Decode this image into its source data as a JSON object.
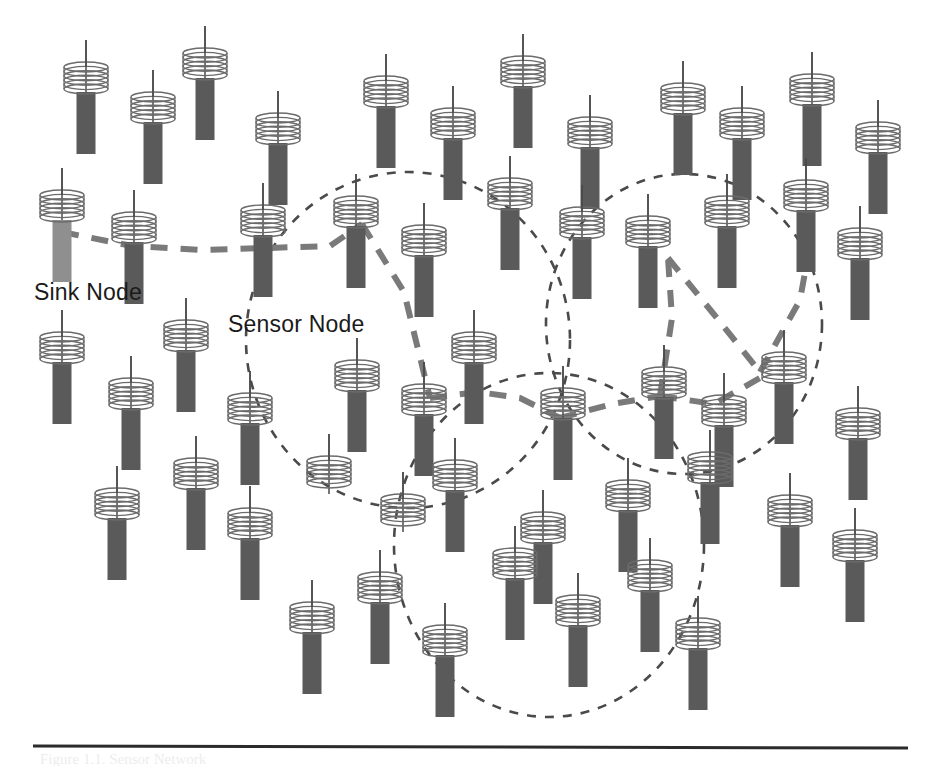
{
  "figure": {
    "background_color": "#ffffff",
    "width": 928,
    "height": 766
  },
  "labels": {
    "sink": "Sink Node",
    "sensor": "Sensor Node",
    "caption_fragment": "Figure 1.1. Sensor Network"
  },
  "colors": {
    "sensor_body": "#5a5a5a",
    "sink_body": "#8f8f8f",
    "coil_stroke": "#6b6b6b",
    "antenna_stroke": "#4a4a4a",
    "cluster_circle": "#4a4a4a",
    "route_link": "#7a7a7a",
    "rule_line": "#2b2b2b",
    "text": "#1a1a1a"
  },
  "glyph": {
    "coil_width": 44,
    "coil_height": 32,
    "coil_turns": 6,
    "body_width": 19,
    "body_height": 62,
    "antenna_height": 22
  },
  "nodes": [
    {
      "id": "n01",
      "x": 86,
      "y": 62,
      "type": "sensor"
    },
    {
      "id": "n02",
      "x": 153,
      "y": 92,
      "type": "sensor"
    },
    {
      "id": "n03",
      "x": 205,
      "y": 48,
      "type": "sensor"
    },
    {
      "id": "n04",
      "x": 278,
      "y": 113,
      "type": "sensor"
    },
    {
      "id": "n05",
      "x": 386,
      "y": 76,
      "type": "sensor"
    },
    {
      "id": "n06",
      "x": 453,
      "y": 108,
      "type": "sensor"
    },
    {
      "id": "n07",
      "x": 523,
      "y": 56,
      "type": "sensor"
    },
    {
      "id": "n08",
      "x": 590,
      "y": 117,
      "type": "sensor"
    },
    {
      "id": "n09",
      "x": 683,
      "y": 83,
      "type": "sensor"
    },
    {
      "id": "n10",
      "x": 742,
      "y": 108,
      "type": "sensor"
    },
    {
      "id": "n11",
      "x": 812,
      "y": 74,
      "type": "sensor"
    },
    {
      "id": "n12",
      "x": 878,
      "y": 122,
      "type": "sensor"
    },
    {
      "id": "n13",
      "x": 62,
      "y": 190,
      "type": "sink"
    },
    {
      "id": "n14",
      "x": 134,
      "y": 212,
      "type": "sensor"
    },
    {
      "id": "n15",
      "x": 263,
      "y": 205,
      "type": "sensor"
    },
    {
      "id": "n16",
      "x": 356,
      "y": 196,
      "type": "sensor"
    },
    {
      "id": "n17",
      "x": 424,
      "y": 225,
      "type": "sensor"
    },
    {
      "id": "n18",
      "x": 510,
      "y": 178,
      "type": "sensor"
    },
    {
      "id": "n19",
      "x": 582,
      "y": 207,
      "type": "sensor"
    },
    {
      "id": "n20",
      "x": 648,
      "y": 216,
      "type": "sensor"
    },
    {
      "id": "n21",
      "x": 727,
      "y": 196,
      "type": "sensor"
    },
    {
      "id": "n22",
      "x": 806,
      "y": 180,
      "type": "sensor"
    },
    {
      "id": "n23",
      "x": 860,
      "y": 228,
      "type": "sensor"
    },
    {
      "id": "n24",
      "x": 62,
      "y": 332,
      "type": "sensor"
    },
    {
      "id": "n25",
      "x": 131,
      "y": 378,
      "type": "sensor"
    },
    {
      "id": "n26",
      "x": 186,
      "y": 320,
      "type": "sensor"
    },
    {
      "id": "n27",
      "x": 250,
      "y": 393,
      "type": "sensor"
    },
    {
      "id": "n28",
      "x": 357,
      "y": 360,
      "type": "sensor"
    },
    {
      "id": "n29",
      "x": 424,
      "y": 384,
      "type": "sensor"
    },
    {
      "id": "n30",
      "x": 474,
      "y": 332,
      "type": "sensor"
    },
    {
      "id": "n31",
      "x": 563,
      "y": 388,
      "type": "sensor"
    },
    {
      "id": "n32",
      "x": 664,
      "y": 367,
      "type": "sensor"
    },
    {
      "id": "n33",
      "x": 724,
      "y": 395,
      "type": "sensor"
    },
    {
      "id": "n34",
      "x": 784,
      "y": 352,
      "type": "sensor"
    },
    {
      "id": "n35",
      "x": 858,
      "y": 408,
      "type": "sensor"
    },
    {
      "id": "n36",
      "x": 117,
      "y": 488,
      "type": "sensor"
    },
    {
      "id": "n37",
      "x": 196,
      "y": 458,
      "type": "sensor"
    },
    {
      "id": "n38",
      "x": 250,
      "y": 508,
      "type": "sensor"
    },
    {
      "id": "n39",
      "x": 329,
      "y": 456,
      "type": "sensor",
      "no_body": true
    },
    {
      "id": "n40",
      "x": 403,
      "y": 494,
      "type": "sensor",
      "no_body": true
    },
    {
      "id": "n41",
      "x": 455,
      "y": 460,
      "type": "sensor"
    },
    {
      "id": "n42",
      "x": 543,
      "y": 512,
      "type": "sensor"
    },
    {
      "id": "n43",
      "x": 628,
      "y": 480,
      "type": "sensor"
    },
    {
      "id": "n44",
      "x": 710,
      "y": 452,
      "type": "sensor"
    },
    {
      "id": "n45",
      "x": 790,
      "y": 495,
      "type": "sensor"
    },
    {
      "id": "n46",
      "x": 855,
      "y": 530,
      "type": "sensor"
    },
    {
      "id": "n47",
      "x": 312,
      "y": 602,
      "type": "sensor"
    },
    {
      "id": "n48",
      "x": 380,
      "y": 572,
      "type": "sensor"
    },
    {
      "id": "n49",
      "x": 445,
      "y": 625,
      "type": "sensor"
    },
    {
      "id": "n50",
      "x": 515,
      "y": 548,
      "type": "sensor"
    },
    {
      "id": "n51",
      "x": 578,
      "y": 595,
      "type": "sensor"
    },
    {
      "id": "n52",
      "x": 650,
      "y": 560,
      "type": "sensor"
    },
    {
      "id": "n53",
      "x": 698,
      "y": 618,
      "type": "sensor"
    }
  ],
  "clusters": [
    {
      "id": "c1",
      "name": "left-cluster",
      "cx": 408,
      "cy": 340,
      "rx": 162,
      "ry": 168
    },
    {
      "id": "c2",
      "name": "right-cluster",
      "cx": 684,
      "cy": 324,
      "rx": 138,
      "ry": 150
    },
    {
      "id": "c3",
      "name": "bottom-cluster",
      "cx": 549,
      "cy": 545,
      "rx": 155,
      "ry": 172
    }
  ],
  "routes": [
    {
      "id": "r1",
      "points": "62,232 132,246 200,250 268,248 330,246 362,224"
    },
    {
      "id": "r2",
      "points": "362,224 404,292 430,398"
    },
    {
      "id": "r3",
      "points": "430,398 478,392 520,398 560,418"
    },
    {
      "id": "r4",
      "points": "560,418 612,404 660,396"
    },
    {
      "id": "r5",
      "points": "660,396 672,318 668,258"
    },
    {
      "id": "r6",
      "points": "668,258 712,312 760,372"
    },
    {
      "id": "r7",
      "points": "760,372 800,300 812,234"
    },
    {
      "id": "r8",
      "points": "660,396 714,404 760,378"
    }
  ],
  "annotations": {
    "sink_label_pos": {
      "x": 34,
      "y": 300
    },
    "sensor_label_pos": {
      "x": 228,
      "y": 332
    }
  },
  "rule": {
    "x1": 33,
    "y1": 746,
    "x2": 908,
    "y2": 748
  }
}
